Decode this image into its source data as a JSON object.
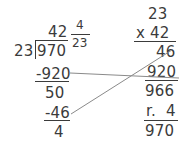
{
  "problem": {
    "type": "long-division-with-check",
    "expression": "970 ÷ 23",
    "dividend": "970",
    "divisor": "23",
    "quotient_whole": "42",
    "remainder": "4",
    "quotient_mixed": "42 4/23"
  },
  "division": {
    "divisor": "23",
    "dividend": "970",
    "quotient_whole": "42",
    "fraction_numerator": "4",
    "fraction_denominator": "23",
    "subtract_step_1": "-920",
    "bring_down_remainder": "50",
    "subtract_step_2": "-46",
    "final_remainder": "4"
  },
  "check": {
    "multiplicand": "23",
    "multiplier": "x 42",
    "partial_product_1": "46",
    "partial_product_2": "920",
    "product": "966",
    "remainder_line": "r.  4",
    "total": "970"
  },
  "connectors": [
    {
      "name": "connector-920",
      "from": "division-subtract-step-1",
      "to": "check-partial-product-2",
      "x1": 70,
      "y1": 73,
      "x2": 179,
      "y2": 78,
      "color": "#8a8a8a"
    },
    {
      "name": "connector-46",
      "from": "division-subtract-step-2",
      "to": "check-partial-product-1",
      "x1": 71,
      "y1": 114,
      "x2": 172,
      "y2": 50,
      "color": "#8a8a8a"
    }
  ],
  "colors": {
    "ink": "#3b3b3b",
    "connector": "#8a8a8a",
    "background": "#ffffff"
  }
}
